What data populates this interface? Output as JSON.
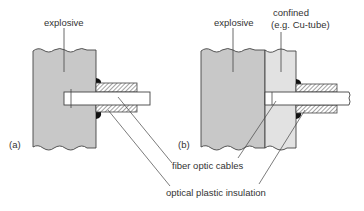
{
  "panels": [
    {
      "id": "a",
      "tag": "(a)",
      "labels": {
        "explosive": "explosive"
      }
    },
    {
      "id": "b",
      "tag": "(b)",
      "labels": {
        "explosive": "explosive",
        "confined_line1": "confined",
        "confined_line2": "(e.g. Cu-tube)"
      }
    }
  ],
  "shared_labels": {
    "fiber": "fiber optic cables",
    "insulation": "optical plastic insulation"
  },
  "colors": {
    "explosive_fill": "#c8c8c8",
    "confined_fill": "#e2e2e2",
    "outline": "#444444",
    "seal": "#111111",
    "text": "#333333"
  }
}
